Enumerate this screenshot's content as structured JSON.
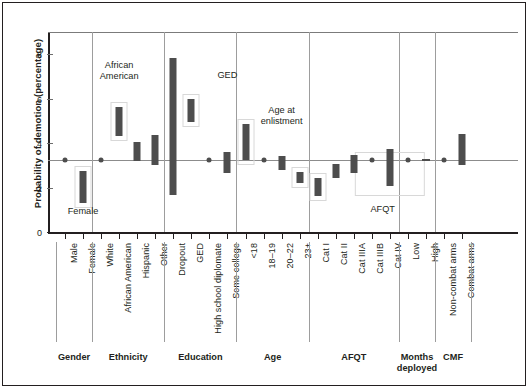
{
  "chart_data": {
    "type": "bar",
    "title": "",
    "subtitle": "",
    "xlabel": "",
    "ylabel": "Probability of demotion (percentage)",
    "ylim": [
      0,
      9
    ],
    "yticks": [
      0,
      2,
      4,
      6,
      8
    ],
    "ytick_labels": [
      "0",
      "2",
      "4",
      "6",
      "8"
    ],
    "grid": false,
    "legend": "none",
    "reference_line": 3.25,
    "note": "Each category is drawn as a vertical confidence-interval bar (low to high); reference categories are drawn as a single point on the reference line at 3.25.",
    "groups": [
      {
        "name": "Gender",
        "categories": [
          {
            "label": "Male",
            "kind": "point",
            "value": 3.25
          },
          {
            "label": "Female",
            "kind": "range",
            "low": 1.32,
            "high": 2.76,
            "boxed": true,
            "annotation": "Female"
          }
        ]
      },
      {
        "name": "Ethnicity",
        "categories": [
          {
            "label": "White",
            "kind": "point",
            "value": 3.25
          },
          {
            "label": "African\nAmerican",
            "kind": "range",
            "low": 4.32,
            "high": 5.62,
            "boxed": true,
            "annotation": "African\nAmerican"
          },
          {
            "label": "Hispanic",
            "kind": "range",
            "low": 3.18,
            "high": 4.06
          },
          {
            "label": "Other",
            "kind": "range",
            "low": 3.02,
            "high": 4.36
          }
        ]
      },
      {
        "name": "Education",
        "categories": [
          {
            "label": "Dropout",
            "kind": "range",
            "low": 1.65,
            "high": 7.84
          },
          {
            "label": "GED",
            "kind": "range",
            "low": 4.95,
            "high": 5.98,
            "boxed": true,
            "annotation": "GED"
          },
          {
            "label": "High school diplomate",
            "kind": "point",
            "value": 3.25
          },
          {
            "label": "Some college",
            "kind": "range",
            "low": 2.65,
            "high": 3.62
          }
        ]
      },
      {
        "name": "Age",
        "categories": [
          {
            "label": "<18",
            "kind": "range",
            "low": 3.22,
            "high": 4.86,
            "boxed": true,
            "annotation": "Age at\nenlistment"
          },
          {
            "label": "18–19",
            "kind": "point",
            "value": 3.25
          },
          {
            "label": "20–22",
            "kind": "range",
            "low": 2.8,
            "high": 3.42
          },
          {
            "label": "23+",
            "kind": "range",
            "low": 2.22,
            "high": 2.72,
            "boxed": true
          }
        ]
      },
      {
        "name": "AFQT",
        "categories": [
          {
            "label": "Cat I",
            "kind": "range",
            "low": 1.62,
            "high": 2.45,
            "boxed": true
          },
          {
            "label": "Cat II",
            "kind": "range",
            "low": 2.42,
            "high": 3.06
          },
          {
            "label": "Cat IIIA",
            "kind": "range",
            "low": 2.66,
            "high": 3.48
          },
          {
            "label": "Cat IIIB",
            "kind": "point",
            "value": 3.25
          },
          {
            "label": "Cat IV",
            "kind": "range",
            "low": 2.05,
            "high": 3.72
          }
        ]
      },
      {
        "name": "Months\ndeployed",
        "categories": [
          {
            "label": "Low",
            "kind": "point",
            "value": 3.25
          },
          {
            "label": "High",
            "kind": "flat",
            "value": 3.25
          }
        ]
      },
      {
        "name": "CMF",
        "categories": [
          {
            "label": "Non-combat arms",
            "kind": "point",
            "value": 3.25
          },
          {
            "label": "Combat arms",
            "kind": "range",
            "low": 3.0,
            "high": 4.4
          }
        ]
      }
    ],
    "annotations": [
      {
        "text": "Female",
        "near": "Female"
      },
      {
        "text": "African\nAmerican",
        "near": "African American"
      },
      {
        "text": "GED",
        "near": "GED"
      },
      {
        "text": "Age at\nenlistment",
        "near": "<18"
      },
      {
        "text": "AFQT",
        "near": "Cat I"
      }
    ],
    "colors": {
      "bar": "#4d4d4d",
      "axis": "#231f20",
      "reference_line": "#8c8c8c",
      "divider": "#9d9d9d",
      "callout_box": "#d8d8d8",
      "background": "#ffffff"
    }
  }
}
